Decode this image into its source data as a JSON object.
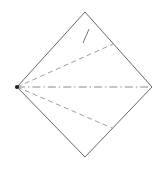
{
  "figure": {
    "canvas": {
      "width": 164,
      "height": 171,
      "background": "#ffffff"
    },
    "colors": {
      "outline": "#555555",
      "dashed_fold": "#8a8a8a",
      "center_axis": "#777777",
      "tick": "#666666",
      "vertex_point": "#222222"
    },
    "vertices": {
      "top": {
        "x": 85,
        "y": 12,
        "label": "top-vertex"
      },
      "right": {
        "x": 152,
        "y": 87,
        "label": "right-vertex"
      },
      "bottom": {
        "x": 85,
        "y": 157,
        "label": "bottom-vertex"
      },
      "left": {
        "x": 17,
        "y": 87,
        "label": "left-vertex"
      }
    },
    "outline_path": "M 85 12 L 152 87 L 85 157 L 17 87 Z",
    "center_axis": {
      "name": "horizontal-center-axis",
      "style": "dash-dot",
      "from": {
        "x": 17,
        "y": 87
      },
      "to": {
        "x": 152,
        "y": 87
      }
    },
    "fold_lines": [
      {
        "name": "upper-fold-line",
        "style": "dashed",
        "from": {
          "x": 17,
          "y": 87
        },
        "to": {
          "x": 113,
          "y": 44
        }
      },
      {
        "name": "lower-fold-line",
        "style": "dashed",
        "from": {
          "x": 17,
          "y": 87
        },
        "to": {
          "x": 112,
          "y": 128
        }
      }
    ],
    "tick_mark": {
      "name": "apex-tick-mark",
      "style": "solid",
      "from": {
        "x": 89,
        "y": 29
      },
      "to": {
        "x": 83,
        "y": 43
      }
    },
    "vertex_marker": {
      "name": "left-vertex-point",
      "cx": 17,
      "cy": 87,
      "r": 2.1
    }
  }
}
